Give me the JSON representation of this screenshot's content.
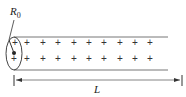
{
  "diagram": {
    "type": "charged cylinder",
    "labels": {
      "radius": "R",
      "radius_sub": "0",
      "length": "L"
    },
    "charge_symbol": "+",
    "charge_rows": [
      {
        "y": 46,
        "xs": [
          15,
          27,
          43,
          58,
          74,
          89,
          104,
          120,
          135,
          150
        ]
      },
      {
        "y": 62,
        "xs": [
          14,
          27,
          43,
          58,
          74,
          89,
          104,
          120,
          135,
          150
        ]
      }
    ],
    "colors": {
      "line": "#555555",
      "text": "#222222"
    }
  }
}
